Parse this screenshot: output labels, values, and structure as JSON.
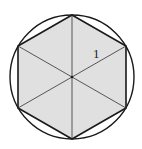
{
  "diagram": {
    "type": "circle-inscribed-hexagon",
    "circle": {
      "cx": 72,
      "cy": 77,
      "r": 62
    },
    "hexagon": {
      "points": [
        [
          72,
          15
        ],
        [
          126,
          46
        ],
        [
          126,
          108
        ],
        [
          72,
          139
        ],
        [
          18,
          108
        ],
        [
          18,
          46
        ]
      ],
      "fill": "#e0e0e0",
      "stroke": "#1a1a1a"
    },
    "diagonals": [
      [
        [
          72,
          15
        ],
        [
          72,
          139
        ]
      ],
      [
        [
          126,
          46
        ],
        [
          18,
          108
        ]
      ],
      [
        [
          126,
          108
        ],
        [
          18,
          46
        ]
      ]
    ],
    "center_label": "",
    "side_label": "1",
    "colors": {
      "outline": "#1a1a1a",
      "shading": "#e0e0e0",
      "inner_lines": "#555555"
    }
  }
}
